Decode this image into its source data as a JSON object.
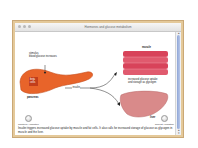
{
  "window": {
    "title": "Hormones and glucose metabolism"
  },
  "diagram": {
    "stimulus_label": "stimulus",
    "stimulus_detail": "blood glucose increases",
    "beta_cells_label_line1": "beta",
    "beta_cells_label_line2": "cells",
    "pancreas_label": "pancreas",
    "insulin_label": "insulin",
    "muscle_label": "muscle",
    "liver_label": "liver",
    "response_line1": "increased glucose uptake",
    "response_line2": "and storage as glycogen",
    "colors": {
      "pancreas": "#e8642a",
      "muscle": "#d8435a",
      "liver": "#d98a8a",
      "window_border": "#e4c99a",
      "scrollbar": "#9fb3de"
    }
  },
  "controls": {
    "continue_label": "Continue Animation",
    "repeat_label": "Repeat Animation"
  },
  "caption": {
    "text": "Insulin triggers increased glucose uptake by muscle and fat cells. It also calls for increased storage of glucose as glycogen in muscle and the liver."
  }
}
